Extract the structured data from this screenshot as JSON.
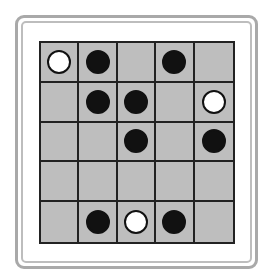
{
  "board": {
    "rows": 5,
    "cols": 5,
    "colors": {
      "cell": "#bebebe",
      "grid_line": "#222222",
      "black_piece": "#111111",
      "white_piece": "#ffffff",
      "frame": "#a9a9a9"
    },
    "pieces": [
      {
        "row": 0,
        "col": 0,
        "color": "white"
      },
      {
        "row": 0,
        "col": 1,
        "color": "black"
      },
      {
        "row": 0,
        "col": 3,
        "color": "black"
      },
      {
        "row": 1,
        "col": 1,
        "color": "black"
      },
      {
        "row": 1,
        "col": 2,
        "color": "black"
      },
      {
        "row": 1,
        "col": 4,
        "color": "white"
      },
      {
        "row": 2,
        "col": 2,
        "color": "black"
      },
      {
        "row": 2,
        "col": 4,
        "color": "black"
      },
      {
        "row": 4,
        "col": 1,
        "color": "black"
      },
      {
        "row": 4,
        "col": 2,
        "color": "white"
      },
      {
        "row": 4,
        "col": 3,
        "color": "black"
      }
    ]
  }
}
